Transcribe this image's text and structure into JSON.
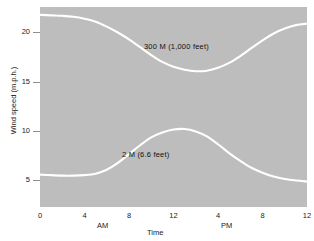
{
  "chart_data": {
    "type": "line",
    "title": "",
    "subtitle": "",
    "xlabel": "Time",
    "ylabel": "Wind speed  (m.p.h.)",
    "xlim": [
      0,
      24
    ],
    "ylim": [
      2.2,
      22.6
    ],
    "grid": false,
    "legend_position": "inline-annotations",
    "plot_background": "#bdbdbd",
    "line_color": "#ffffff",
    "x_ticks": [
      {
        "value": 0,
        "label": "0"
      },
      {
        "value": 4,
        "label": "4"
      },
      {
        "value": 8,
        "label": "8"
      },
      {
        "value": 12,
        "label": "12"
      },
      {
        "value": 16,
        "label": "4"
      },
      {
        "value": 20,
        "label": "8"
      },
      {
        "value": 24,
        "label": "12"
      }
    ],
    "y_ticks": [
      {
        "value": 5,
        "label": "5"
      },
      {
        "value": 10,
        "label": "10"
      },
      {
        "value": 15,
        "label": "15"
      },
      {
        "value": 20,
        "label": "20"
      }
    ],
    "x_period_labels": [
      {
        "text": "AM",
        "at": 6.5
      },
      {
        "text": "PM",
        "at": 18.2
      }
    ],
    "series": [
      {
        "name": "300 M  (1,000 feet)",
        "annotation": "300 M   (1,000 feet)",
        "x": [
          0,
          1,
          2,
          3,
          4,
          5,
          6,
          7,
          8,
          9,
          10,
          11,
          12,
          13,
          14,
          15,
          16,
          17,
          18,
          19,
          20,
          21,
          22,
          23,
          24
        ],
        "values": [
          21.8,
          21.75,
          21.7,
          21.6,
          21.4,
          21.1,
          20.6,
          20.0,
          19.3,
          18.5,
          17.7,
          17.0,
          16.5,
          16.2,
          16.05,
          16.1,
          16.4,
          16.9,
          17.6,
          18.4,
          19.2,
          19.9,
          20.4,
          20.75,
          20.9
        ]
      },
      {
        "name": "2 M  (6.6 feet)",
        "annotation": "2 M   (6.6 feet)",
        "x": [
          0,
          1,
          2,
          3,
          4,
          5,
          6,
          7,
          8,
          9,
          10,
          11,
          12,
          13,
          14,
          15,
          16,
          17,
          18,
          19,
          20,
          21,
          22,
          23,
          24
        ],
        "values": [
          5.5,
          5.45,
          5.4,
          5.4,
          5.45,
          5.6,
          6.0,
          6.7,
          7.6,
          8.5,
          9.3,
          9.8,
          10.1,
          10.15,
          9.9,
          9.4,
          8.6,
          7.7,
          6.9,
          6.2,
          5.7,
          5.3,
          5.05,
          4.9,
          4.8
        ]
      }
    ]
  }
}
